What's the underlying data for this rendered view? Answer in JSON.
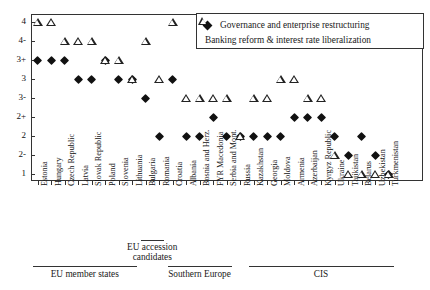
{
  "chart_data": {
    "type": "scatter",
    "title": "",
    "xlabel": "",
    "ylabel": "",
    "grid": false,
    "legend_position": "top-right",
    "y_axis": {
      "tick_labels": [
        "4",
        "4-",
        "3+",
        "3",
        "3-",
        "2+",
        "2",
        "2-",
        "1"
      ],
      "note": "ordinal transition-indicator scale from 1 (lowest) to 4 (highest)"
    },
    "categories": [
      "Estonia",
      "Hungary",
      "Czech Republic",
      "Latvia",
      "Slovak Republic",
      "Poland",
      "Slovenia",
      "Lithuania",
      "Bulgaria",
      "Romania",
      "Croatia",
      "Albania",
      "Bosnia and Herz.",
      "FYR Macedonia",
      "Serbia and Mont.",
      "Russia",
      "Kazakhstan",
      "Georgia",
      "Moldova",
      "Armenia",
      "Azerbaijan",
      "Kyrgyz Republic",
      "Ukraine",
      "Tajikistan",
      "Belarus",
      "Uzbekistan",
      "Turkmenistan"
    ],
    "series": [
      {
        "name": "Governance and enterprise restructuring",
        "marker": "filled-diamond",
        "color": "#111111",
        "values": [
          "3+",
          "3+",
          "3+",
          "3",
          "3",
          "3+",
          "3",
          "3",
          "3-",
          "2",
          "3",
          "2",
          "2",
          "2+",
          "2",
          "2",
          "2",
          "2",
          "2",
          "2+",
          "2+",
          "2+",
          "2",
          "2-",
          "2",
          "2-",
          "1"
        ]
      },
      {
        "name": "Banking reform & interest rate liberalization",
        "marker": "open-triangle",
        "color": "#222222",
        "values": [
          "4",
          "4",
          "4-",
          "4-",
          "4-",
          "3+",
          "3+",
          "3",
          "4-",
          "3",
          "4",
          "3-",
          "3-",
          "3-",
          "3-",
          "2",
          "3-",
          "3-",
          "3",
          "3",
          "3-",
          "3-",
          "2-",
          "1",
          "1",
          "1",
          "1"
        ]
      }
    ],
    "groups": [
      {
        "label": "EU member states",
        "start": "Estonia",
        "end": "Lithuania"
      },
      {
        "label": "EU accession candidates",
        "start": "Bulgaria",
        "end": "Romania"
      },
      {
        "label": "Southern Europe",
        "start": "Croatia",
        "end": "Serbia and Mont."
      },
      {
        "label": "CIS",
        "start": "Kazakhstan",
        "end": "Turkmenistan"
      }
    ]
  },
  "legend": {
    "items": [
      {
        "label": "Governance and enterprise restructuring",
        "key": "filled-diamond-icon"
      },
      {
        "label": "Banking reform & interest rate liberalization",
        "key": "open-triangle-icon"
      }
    ]
  },
  "groups": {
    "eu_member": "EU member states",
    "eu_accession": "EU accession candidates",
    "southern_europe": "Southern Europe",
    "cis": "CIS"
  }
}
